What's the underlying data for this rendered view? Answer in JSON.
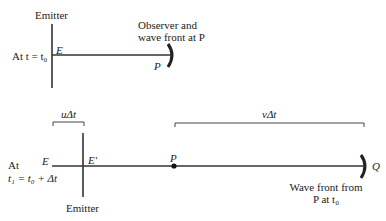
{
  "top_panel": {
    "emitter_label": "Emitter",
    "time_label": "At t = t₀",
    "point_e": "E",
    "point_p": "P",
    "observer_label_line1": "Observer and",
    "observer_label_line2": "wave front at P"
  },
  "bottom_panel": {
    "time_label_line1": "At",
    "time_label_line2": "t₁ = t₀ + Δt",
    "point_e": "E",
    "point_e_prime": "E′",
    "point_p": "P",
    "point_q": "Q",
    "emitter_label": "Emitter",
    "bracket_u": "uΔt",
    "bracket_v": "vΔt",
    "wavefront_label_line1": "Wave front from",
    "wavefront_label_line2": "P at t₀"
  },
  "colors": {
    "line": "#333333",
    "text": "#222222",
    "background": "#ffffff"
  }
}
